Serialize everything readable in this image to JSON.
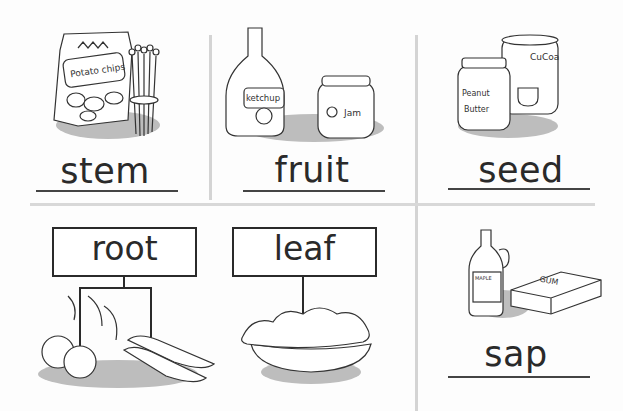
{
  "cells": [
    {
      "id": "stem",
      "word": "stem",
      "items": [
        "Potato chips",
        "asparagus"
      ]
    },
    {
      "id": "fruit",
      "word": "fruit",
      "items": [
        "ketchup",
        "Jam"
      ]
    },
    {
      "id": "seed",
      "word": "seed",
      "items": [
        "Peanut Butter",
        "CuCoa"
      ]
    },
    {
      "id": "root",
      "word": "root",
      "items": [
        "beets",
        "carrots"
      ]
    },
    {
      "id": "leaf",
      "word": "leaf",
      "items": [
        "salad"
      ]
    },
    {
      "id": "sap",
      "word": "sap",
      "items": [
        "MAPLE syrup",
        "GUM"
      ]
    }
  ],
  "colors": {
    "ink": "#2a2a2a",
    "shadow": "#bdbdbd",
    "divider": "#d4d4d4",
    "background": "#fdfdfd"
  }
}
